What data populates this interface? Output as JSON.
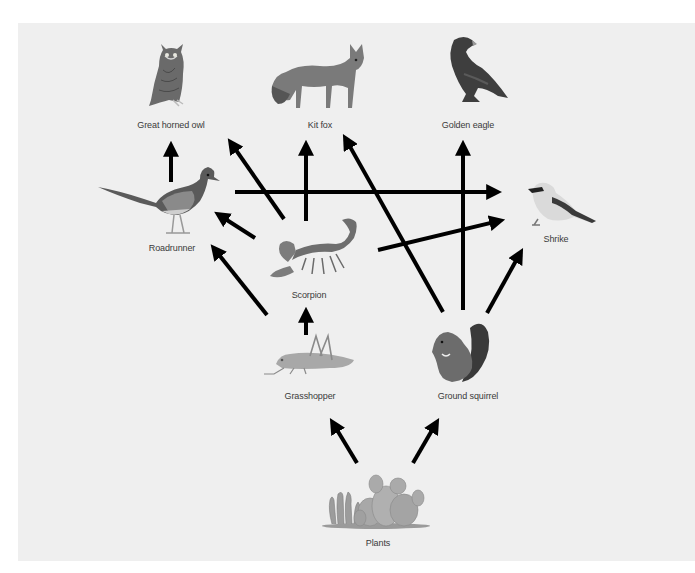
{
  "diagram": {
    "background_color": "#efefef",
    "arrow_color": "#000000",
    "organisms": [
      {
        "id": "great_horned_owl",
        "label": "Great horned owl",
        "icon": "owl-icon",
        "x": 171,
        "y": 126
      },
      {
        "id": "kit_fox",
        "label": "Kit fox",
        "icon": "fox-icon",
        "x": 320,
        "y": 126
      },
      {
        "id": "golden_eagle",
        "label": "Golden eagle",
        "icon": "eagle-icon",
        "x": 468,
        "y": 126
      },
      {
        "id": "roadrunner",
        "label": "Roadrunner",
        "icon": "roadrunner-icon",
        "x": 172,
        "y": 249
      },
      {
        "id": "scorpion",
        "label": "Scorpion",
        "icon": "scorpion-icon",
        "x": 309,
        "y": 296
      },
      {
        "id": "shrike",
        "label": "Shrike",
        "icon": "shrike-icon",
        "x": 556,
        "y": 240
      },
      {
        "id": "grasshopper",
        "label": "Grasshopper",
        "icon": "grasshopper-icon",
        "x": 310,
        "y": 397
      },
      {
        "id": "ground_squirrel",
        "label": "Ground squirrel",
        "icon": "squirrel-icon",
        "x": 468,
        "y": 397
      },
      {
        "id": "plants",
        "label": "Plants",
        "icon": "cactus-icon",
        "x": 378,
        "y": 544
      }
    ],
    "arrows": [
      {
        "from": "roadrunner",
        "to": "great_horned_owl",
        "x1": 171,
        "y1": 182,
        "x2": 171,
        "y2": 143
      },
      {
        "from": "scorpion",
        "to": "great_horned_owl",
        "x1": 284,
        "y1": 219,
        "x2": 229,
        "y2": 140
      },
      {
        "from": "scorpion",
        "to": "kit_fox",
        "x1": 306,
        "y1": 221,
        "x2": 306,
        "y2": 142
      },
      {
        "from": "ground_squirrel",
        "to": "kit_fox",
        "x1": 443,
        "y1": 312,
        "x2": 344,
        "y2": 136
      },
      {
        "from": "ground_squirrel",
        "to": "golden_eagle",
        "x1": 463,
        "y1": 310,
        "x2": 463,
        "y2": 142
      },
      {
        "from": "roadrunner",
        "to": "shrike",
        "x1": 235,
        "y1": 192,
        "x2": 500,
        "y2": 192
      },
      {
        "from": "scorpion",
        "to": "roadrunner",
        "x1": 255,
        "y1": 238,
        "x2": 216,
        "y2": 213
      },
      {
        "from": "grasshopper",
        "to": "roadrunner",
        "x1": 267,
        "y1": 315,
        "x2": 212,
        "y2": 246
      },
      {
        "from": "scorpion",
        "to": "shrike",
        "x1": 378,
        "y1": 250,
        "x2": 503,
        "y2": 220
      },
      {
        "from": "ground_squirrel",
        "to": "shrike",
        "x1": 487,
        "y1": 313,
        "x2": 522,
        "y2": 250
      },
      {
        "from": "grasshopper",
        "to": "scorpion",
        "x1": 306,
        "y1": 335,
        "x2": 306,
        "y2": 309
      },
      {
        "from": "plants",
        "to": "grasshopper",
        "x1": 357,
        "y1": 463,
        "x2": 331,
        "y2": 420
      },
      {
        "from": "plants",
        "to": "ground_squirrel",
        "x1": 413,
        "y1": 463,
        "x2": 438,
        "y2": 420
      }
    ]
  }
}
